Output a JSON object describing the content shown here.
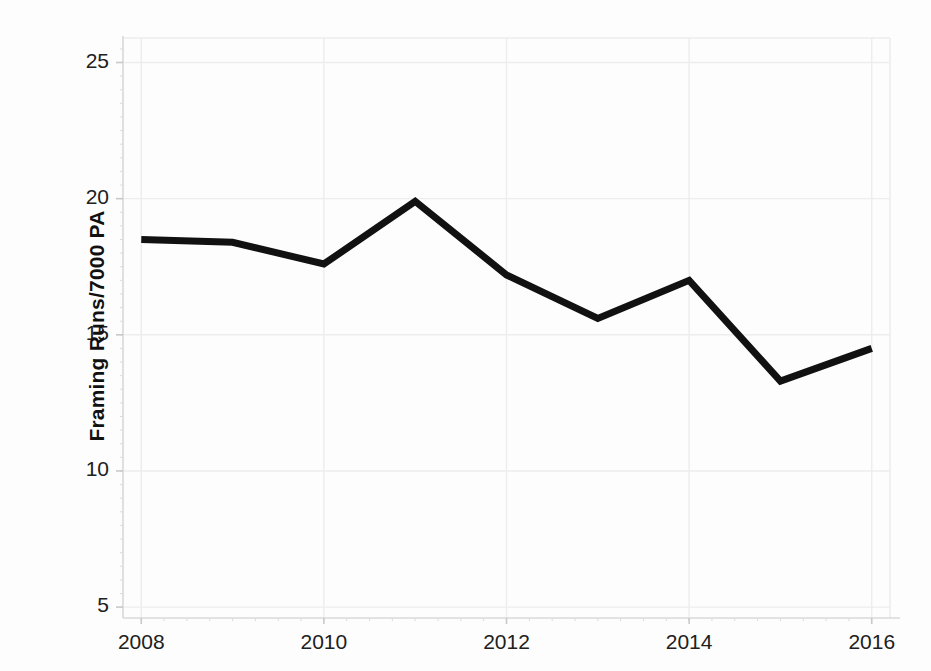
{
  "chart_data": {
    "type": "line",
    "title": "",
    "xlabel": "",
    "ylabel": "Framing Runs/7000 PA",
    "x": [
      2008,
      2009,
      2010,
      2011,
      2012,
      2013,
      2014,
      2015,
      2016
    ],
    "values": [
      18.5,
      18.4,
      17.6,
      19.9,
      17.2,
      15.6,
      17.0,
      13.3,
      14.5
    ],
    "series": [
      {
        "name": "Framing Runs/7000 PA",
        "values": [
          18.5,
          18.4,
          17.6,
          19.9,
          17.2,
          15.6,
          17.0,
          13.3,
          14.5
        ],
        "color": "#111111"
      }
    ],
    "xlim": [
      2007.8,
      2016.2
    ],
    "ylim": [
      4.6,
      25.9
    ],
    "xticks": [
      2008,
      2010,
      2012,
      2014,
      2016
    ],
    "xtick_labels": [
      "2008",
      "2010",
      "2012",
      "2014",
      "2016"
    ],
    "yticks": [
      5,
      10,
      15,
      20,
      25
    ],
    "ytick_labels": [
      "5",
      "10",
      "15",
      "20",
      "25"
    ],
    "grid": true,
    "grid_color": "#ededed",
    "legend": false,
    "legend_position": "none",
    "line_width": 7,
    "markers": "none",
    "background_color": "#ffffff",
    "axis_color": "#d8d8d8"
  },
  "axes": {
    "y_title": "Framing Runs/7000 PA",
    "x_title": ""
  }
}
